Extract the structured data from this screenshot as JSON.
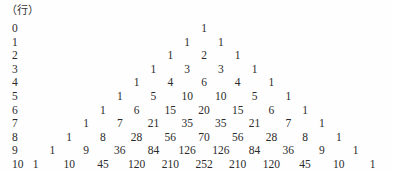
{
  "page": {
    "background_color": "#fefefe",
    "text_color": "#2b2b2b",
    "unit_label": "（行）"
  },
  "layout": {
    "apex_center_x": 204,
    "column_spacing": 33.7,
    "first_row_baseline_y": 22,
    "row_height": 13.6,
    "row_label_x": 12
  },
  "chart_data": {
    "type": "table",
    "title": "（行）",
    "xlabel": "",
    "ylabel": "行",
    "grid": false,
    "legend": null,
    "row_labels": [
      "0",
      "1",
      "2",
      "3",
      "4",
      "5",
      "6",
      "7",
      "8",
      "9",
      "10"
    ],
    "rows": [
      [
        1
      ],
      [
        1,
        1
      ],
      [
        1,
        2,
        1
      ],
      [
        1,
        3,
        3,
        1
      ],
      [
        1,
        4,
        6,
        4,
        1
      ],
      [
        1,
        5,
        10,
        10,
        5,
        1
      ],
      [
        1,
        6,
        15,
        20,
        15,
        6,
        1
      ],
      [
        1,
        7,
        21,
        35,
        35,
        21,
        7,
        1
      ],
      [
        1,
        8,
        28,
        56,
        70,
        56,
        28,
        8,
        1
      ],
      [
        1,
        9,
        36,
        84,
        126,
        126,
        84,
        36,
        9,
        1
      ],
      [
        1,
        10,
        45,
        120,
        210,
        252,
        210,
        120,
        45,
        10,
        1
      ]
    ]
  }
}
